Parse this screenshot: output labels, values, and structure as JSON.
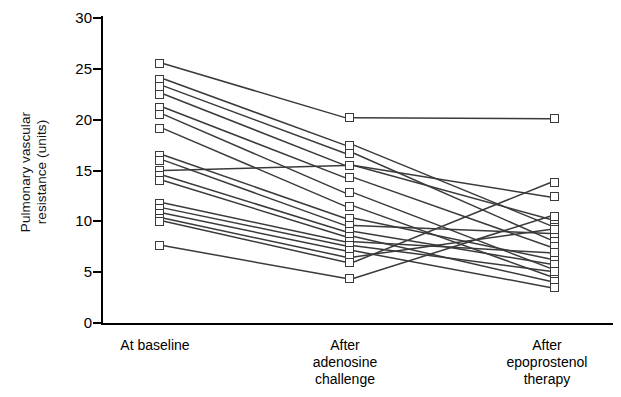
{
  "chart_data": {
    "type": "line",
    "title": "",
    "subtitle": "",
    "xlabel": "",
    "ylabel": "Pulmonary vascular resistance (units)",
    "ylabel_lines": [
      "Pulmonary vascular",
      "resistance (units)"
    ],
    "categories": [
      "At baseline",
      "After adenosine challenge",
      "After epoprostenol therapy"
    ],
    "category_lines": [
      [
        "At baseline"
      ],
      [
        "After",
        "adenosine",
        "challenge"
      ],
      [
        "After",
        "epoprostenol",
        "therapy"
      ]
    ],
    "ylim": [
      0,
      30
    ],
    "yticks": [
      0,
      5,
      10,
      15,
      20,
      25,
      30
    ],
    "ytick_labels": [
      "0",
      "5",
      "10",
      "15",
      "20",
      "25",
      "30"
    ],
    "grid": false,
    "legend": "none",
    "marker": "open-square",
    "line_color": "#3a3a3a",
    "marker_face_color": "#ffffff",
    "marker_edge_color": "#3a3a3a",
    "n_subjects": 18,
    "series": [
      {
        "name": "Subject 1",
        "values": [
          25.5,
          20.2,
          20.1
        ]
      },
      {
        "name": "Subject 2",
        "values": [
          24.0,
          17.5,
          9.6
        ]
      },
      {
        "name": "Subject 3",
        "values": [
          23.3,
          16.7,
          8.2
        ]
      },
      {
        "name": "Subject 4",
        "values": [
          22.5,
          15.5,
          10.2
        ]
      },
      {
        "name": "Subject 5",
        "values": [
          21.2,
          14.3,
          7.5
        ]
      },
      {
        "name": "Subject 6",
        "values": [
          20.5,
          12.8,
          5.4
        ]
      },
      {
        "name": "Subject 7",
        "values": [
          19.1,
          11.5,
          4.6
        ]
      },
      {
        "name": "Subject 8",
        "values": [
          16.5,
          10.3,
          6.3
        ]
      },
      {
        "name": "Subject 9",
        "values": [
          16.0,
          9.6,
          8.8
        ]
      },
      {
        "name": "Subject 10",
        "values": [
          15.0,
          15.5,
          12.4
        ]
      },
      {
        "name": "Subject 11",
        "values": [
          14.5,
          9.0,
          5.8
        ]
      },
      {
        "name": "Subject 12",
        "values": [
          14.0,
          8.5,
          4.1
        ]
      },
      {
        "name": "Subject 13",
        "values": [
          11.8,
          8.0,
          6.9
        ]
      },
      {
        "name": "Subject 14",
        "values": [
          11.3,
          7.6,
          5.1
        ]
      },
      {
        "name": "Subject 15",
        "values": [
          10.8,
          7.1,
          3.5
        ]
      },
      {
        "name": "Subject 16",
        "values": [
          10.3,
          6.5,
          9.2
        ]
      },
      {
        "name": "Subject 17",
        "values": [
          10.0,
          6.0,
          13.8
        ]
      },
      {
        "name": "Subject 18",
        "values": [
          7.6,
          4.4,
          10.5
        ]
      }
    ]
  }
}
